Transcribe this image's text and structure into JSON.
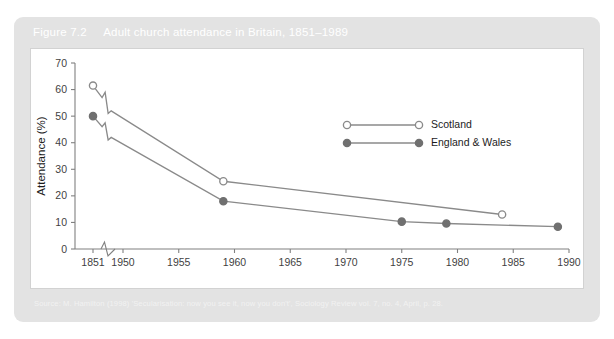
{
  "figure": {
    "number": "Figure 7.2",
    "title": "Adult church attendance in Britain, 1851–1989",
    "caption_bg": "#e3e3e3",
    "caption_color": "#ffffff"
  },
  "source": {
    "text": "Source: M. Hamilton (1998) 'Secularisation: now you see it, now you don't', Sociology Review vol. 7, no. 4, April, p. 28."
  },
  "chart_data": {
    "type": "line",
    "title": "Adult church attendance in Britain, 1851–1989",
    "xlabel": "",
    "ylabel": "Attendance (%)",
    "xlim": [
      1851,
      1990
    ],
    "ylim": [
      0,
      70
    ],
    "yticks": [
      0,
      10,
      20,
      30,
      40,
      50,
      60,
      70
    ],
    "xticks": [
      1851,
      1950,
      1955,
      1960,
      1965,
      1970,
      1975,
      1980,
      1985,
      1990
    ],
    "xtick_labels": [
      "1851",
      "1950",
      "1955",
      "1960",
      "1965",
      "1970",
      "1975",
      "1980",
      "1985",
      "1990"
    ],
    "ytick_labels": [
      "0",
      "10",
      "20",
      "30",
      "40",
      "50",
      "60",
      "70"
    ],
    "grid": false,
    "axis_break": true,
    "legend_position": "upper-right-inside",
    "series": [
      {
        "name": "Scotland",
        "marker": "open-circle",
        "color": "#8a8a8a",
        "marker_fill": "#ffffff",
        "x": [
          1851,
          1881,
          1891,
          1901,
          1911,
          1959,
          1984
        ],
        "y": [
          61.5,
          57.0,
          59.0,
          51.0,
          52.0,
          25.5,
          13.0
        ],
        "marker_at": [
          1851,
          1959,
          1984
        ]
      },
      {
        "name": "England & Wales",
        "marker": "filled-circle",
        "color": "#8a8a8a",
        "marker_fill": "#707070",
        "x": [
          1851,
          1881,
          1891,
          1901,
          1911,
          1959,
          1975,
          1979,
          1989
        ],
        "y": [
          50.0,
          46.0,
          47.5,
          41.0,
          42.0,
          18.0,
          10.3,
          9.6,
          8.4
        ],
        "marker_at": [
          1851,
          1959,
          1975,
          1979,
          1989
        ]
      }
    ],
    "legend": [
      {
        "label": "Scotland",
        "marker": "open-circle"
      },
      {
        "label": "England & Wales",
        "marker": "filled-circle"
      }
    ]
  }
}
